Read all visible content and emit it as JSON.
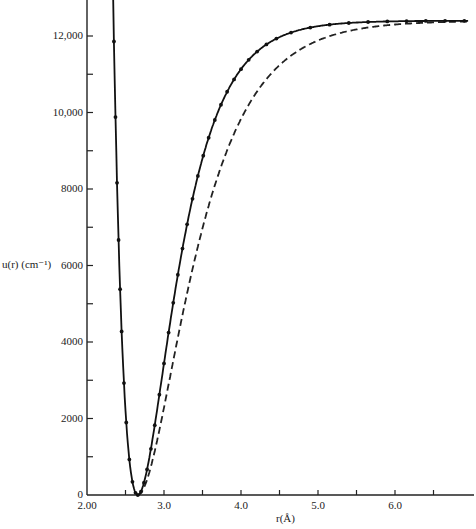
{
  "chart_data": {
    "type": "line",
    "title": "",
    "xlabel": "r(Å)",
    "ylabel": "u(r) (cm⁻¹)",
    "xlim": [
      2.0,
      6.95
    ],
    "ylim": [
      0,
      12900
    ],
    "grid": false,
    "legend": null,
    "x_ticks": [
      {
        "value": 2.0,
        "label": "2.00"
      },
      {
        "value": 2.5,
        "label": ""
      },
      {
        "value": 3.0,
        "label": "3.0"
      },
      {
        "value": 3.5,
        "label": ""
      },
      {
        "value": 4.0,
        "label": "4.0"
      },
      {
        "value": 4.5,
        "label": ""
      },
      {
        "value": 5.0,
        "label": "5.0"
      },
      {
        "value": 5.5,
        "label": ""
      },
      {
        "value": 6.0,
        "label": "6.0"
      },
      {
        "value": 6.5,
        "label": ""
      }
    ],
    "y_ticks": [
      {
        "value": 0,
        "label": "0"
      },
      {
        "value": 1000,
        "label": ""
      },
      {
        "value": 2000,
        "label": "2000"
      },
      {
        "value": 3000,
        "label": ""
      },
      {
        "value": 4000,
        "label": "4000"
      },
      {
        "value": 5000,
        "label": ""
      },
      {
        "value": 6000,
        "label": "6000"
      },
      {
        "value": 7000,
        "label": ""
      },
      {
        "value": 8000,
        "label": "8000"
      },
      {
        "value": 9000,
        "label": ""
      },
      {
        "value": 10000,
        "label": "10,000"
      },
      {
        "value": 11000,
        "label": ""
      },
      {
        "value": 12000,
        "label": "12,000"
      }
    ],
    "series": [
      {
        "name": "experimental (RKR) potential",
        "style": "solid-with-markers",
        "params": {
          "De": 12400,
          "re": 2.66,
          "a": 2.2
        },
        "x": [
          2.28,
          2.29,
          2.3,
          2.31,
          2.32,
          2.33,
          2.35,
          2.37,
          2.39,
          2.41,
          2.43,
          2.45,
          2.48,
          2.51,
          2.55,
          2.59,
          2.63,
          2.66,
          2.7,
          2.74,
          2.78,
          2.83,
          2.88,
          2.94,
          3.0,
          3.06,
          3.12,
          3.18,
          3.24,
          3.3,
          3.37,
          3.44,
          3.51,
          3.58,
          3.66,
          3.74,
          3.82,
          3.91,
          4.0,
          4.1,
          4.21,
          4.33,
          4.46,
          4.65,
          4.9,
          5.15,
          5.4,
          5.65,
          5.9,
          6.15,
          6.4,
          6.65,
          6.9
        ]
      },
      {
        "name": "Morse function",
        "style": "dashed",
        "params": {
          "De": 12400,
          "re": 2.66,
          "a": 1.65
        },
        "x_range": [
          2.28,
          6.9
        ]
      }
    ]
  }
}
